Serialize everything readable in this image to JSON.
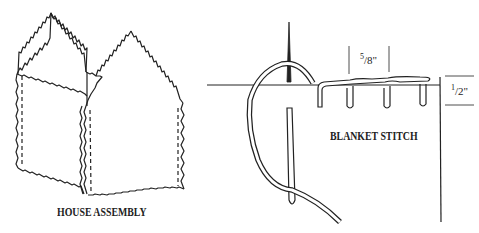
{
  "figures": [
    {
      "id": "house-assembly",
      "caption": "HOUSE ASSEMBLY"
    },
    {
      "id": "blanket-stitch",
      "caption": "BLANKET STITCH",
      "dimensions": {
        "stitch_spacing": {
          "num": "5",
          "den": "8",
          "unit": "\""
        },
        "stitch_depth": {
          "num": "1",
          "den": "2",
          "unit": "\""
        }
      }
    }
  ],
  "colors": {
    "line": "#222222",
    "background": "#ffffff"
  }
}
